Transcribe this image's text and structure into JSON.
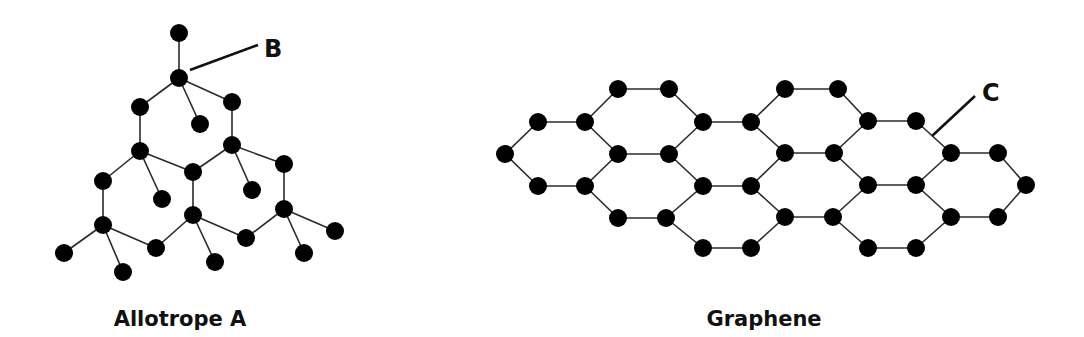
{
  "diagram": {
    "allotrope_a": {
      "caption": "Allotrope A",
      "callout_label": "B",
      "nodes": [
        [
          179,
          33
        ],
        [
          179,
          78
        ],
        [
          140,
          107
        ],
        [
          232,
          102
        ],
        [
          200,
          124
        ],
        [
          140,
          151
        ],
        [
          232,
          145
        ],
        [
          193,
          172
        ],
        [
          284,
          164
        ],
        [
          103,
          181
        ],
        [
          162,
          199
        ],
        [
          252,
          190
        ],
        [
          193,
          215
        ],
        [
          284,
          209
        ],
        [
          103,
          225
        ],
        [
          156,
          248
        ],
        [
          246,
          238
        ],
        [
          335,
          231
        ],
        [
          64,
          253
        ],
        [
          123,
          272
        ],
        [
          215,
          262
        ],
        [
          304,
          253
        ]
      ],
      "edges": [
        [
          0,
          1
        ],
        [
          1,
          2
        ],
        [
          1,
          3
        ],
        [
          1,
          4
        ],
        [
          2,
          5
        ],
        [
          3,
          6
        ],
        [
          5,
          7
        ],
        [
          6,
          7
        ],
        [
          6,
          8
        ],
        [
          5,
          9
        ],
        [
          5,
          10
        ],
        [
          6,
          11
        ],
        [
          7,
          12
        ],
        [
          8,
          13
        ],
        [
          9,
          14
        ],
        [
          14,
          15
        ],
        [
          15,
          12
        ],
        [
          12,
          16
        ],
        [
          16,
          13
        ],
        [
          13,
          17
        ],
        [
          14,
          18
        ],
        [
          14,
          19
        ],
        [
          12,
          20
        ],
        [
          13,
          21
        ]
      ],
      "callout_line": [
        [
          190,
          70
        ],
        [
          258,
          45
        ]
      ],
      "callout_text_pos": [
        264,
        57
      ],
      "caption_pos": [
        180,
        326
      ]
    },
    "graphene": {
      "caption": "Graphene",
      "callout_label": "C",
      "nodes": [
        [
          505,
          154
        ],
        [
          538,
          122
        ],
        [
          585,
          122
        ],
        [
          538,
          186
        ],
        [
          585,
          186
        ],
        [
          618,
          89
        ],
        [
          669,
          89
        ],
        [
          618,
          154
        ],
        [
          669,
          154
        ],
        [
          703,
          122
        ],
        [
          751,
          122
        ],
        [
          618,
          218
        ],
        [
          666,
          218
        ],
        [
          703,
          186
        ],
        [
          751,
          186
        ],
        [
          703,
          248
        ],
        [
          751,
          248
        ],
        [
          785,
          89
        ],
        [
          838,
          89
        ],
        [
          868,
          121
        ],
        [
          916,
          121
        ],
        [
          785,
          153
        ],
        [
          834,
          153
        ],
        [
          951,
          153
        ],
        [
          998,
          153
        ],
        [
          1026,
          185
        ],
        [
          868,
          185
        ],
        [
          916,
          185
        ],
        [
          785,
          217
        ],
        [
          833,
          217
        ],
        [
          951,
          217
        ],
        [
          998,
          217
        ],
        [
          868,
          248
        ],
        [
          916,
          248
        ]
      ],
      "edges": [
        [
          0,
          1
        ],
        [
          1,
          2
        ],
        [
          0,
          3
        ],
        [
          3,
          4
        ],
        [
          2,
          7
        ],
        [
          4,
          7
        ],
        [
          2,
          5
        ],
        [
          5,
          6
        ],
        [
          6,
          9
        ],
        [
          7,
          8
        ],
        [
          8,
          9
        ],
        [
          8,
          13
        ],
        [
          4,
          11
        ],
        [
          11,
          12
        ],
        [
          12,
          13
        ],
        [
          12,
          15
        ],
        [
          15,
          16
        ],
        [
          9,
          10
        ],
        [
          13,
          14
        ],
        [
          10,
          17
        ],
        [
          17,
          18
        ],
        [
          18,
          19
        ],
        [
          10,
          21
        ],
        [
          14,
          21
        ],
        [
          21,
          22
        ],
        [
          22,
          19
        ],
        [
          19,
          20
        ],
        [
          20,
          23
        ],
        [
          23,
          24
        ],
        [
          24,
          25
        ],
        [
          22,
          26
        ],
        [
          26,
          27
        ],
        [
          27,
          23
        ],
        [
          14,
          28
        ],
        [
          28,
          29
        ],
        [
          29,
          26
        ],
        [
          16,
          28
        ],
        [
          29,
          32
        ],
        [
          32,
          33
        ],
        [
          33,
          30
        ],
        [
          27,
          30
        ],
        [
          30,
          31
        ],
        [
          31,
          25
        ]
      ],
      "callout_line": [
        [
          932,
          136
        ],
        [
          975,
          96
        ]
      ],
      "callout_text_pos": [
        982,
        101
      ],
      "caption_pos": [
        764,
        326
      ]
    },
    "style": {
      "node_color": "#000000",
      "edge_color": "#2a2a2a",
      "node_radius": 9
    }
  }
}
